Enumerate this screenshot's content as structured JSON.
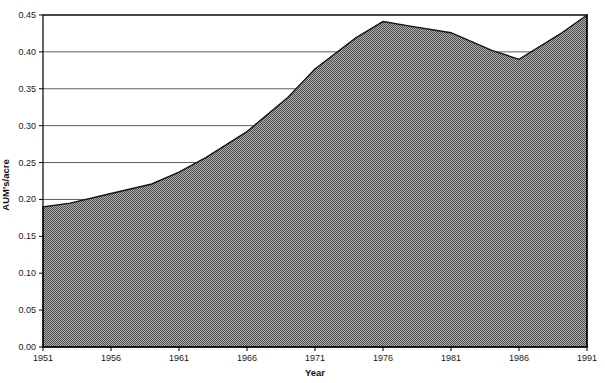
{
  "chart_data": {
    "type": "area",
    "title": "",
    "xlabel": "Year",
    "ylabel": "AUM's/acre",
    "x": [
      1951,
      1953,
      1956,
      1959,
      1961,
      1963,
      1966,
      1969,
      1971,
      1974,
      1976,
      1978,
      1981,
      1984,
      1986,
      1989,
      1991
    ],
    "values": [
      0.19,
      0.195,
      0.208,
      0.221,
      0.237,
      0.257,
      0.292,
      0.338,
      0.377,
      0.419,
      0.441,
      0.435,
      0.426,
      0.402,
      0.39,
      0.424,
      0.45
    ],
    "xlim": [
      1951,
      1991
    ],
    "ylim": [
      0,
      0.45
    ],
    "x_ticks": [
      "1951",
      "1956",
      "1961",
      "1966",
      "1971",
      "1976",
      "1981",
      "1986",
      "1991"
    ],
    "y_ticks": [
      "0.00",
      "0.05",
      "0.10",
      "0.15",
      "0.20",
      "0.25",
      "0.30",
      "0.35",
      "0.40",
      "0.45"
    ],
    "y_tick_step": 0.05,
    "grid": "horizontal",
    "legend": "none",
    "fill_style": "halftone-gray-checker",
    "fill_checker_dark": "#4f4f4f",
    "fill_checker_light": "#aeaeae",
    "outline_color": "#141414",
    "gridline_color": "#5e5e5e",
    "axis_color": "#000000",
    "background": "#ffffff"
  }
}
